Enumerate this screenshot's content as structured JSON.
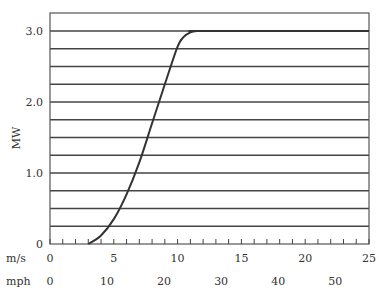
{
  "chart_data": {
    "type": "line",
    "title": "",
    "ylabel": "MW",
    "xlabel_primary": "m/s",
    "xlabel_secondary": "mph",
    "ylim": [
      0,
      3.25
    ],
    "xlim": [
      0,
      25
    ],
    "y_ticks": [
      "0",
      "1.0",
      "2.0",
      "3.0"
    ],
    "y_tick_values": [
      0,
      1.0,
      2.0,
      3.0
    ],
    "x_ticks_ms": [
      "0",
      "5",
      "10",
      "15",
      "20",
      "25"
    ],
    "x_tick_values_ms": [
      0,
      5,
      10,
      15,
      20,
      25
    ],
    "x_ticks_mph": [
      "0",
      "10",
      "20",
      "30",
      "40",
      "50"
    ],
    "x_tick_values_mph": [
      0,
      10,
      20,
      30,
      40,
      50
    ],
    "grid": "horizontal every 0.25 MW",
    "series": [
      {
        "name": "Power curve",
        "x": [
          3,
          4,
          5,
          6,
          7,
          8,
          9,
          10,
          10.5,
          11,
          11.5,
          12,
          25
        ],
        "y": [
          0.0,
          0.12,
          0.35,
          0.7,
          1.15,
          1.7,
          2.25,
          2.78,
          2.92,
          2.98,
          3.0,
          3.0,
          3.0
        ]
      }
    ]
  }
}
